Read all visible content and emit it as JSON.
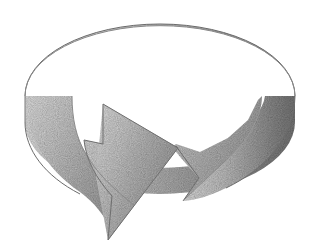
{
  "figure": {
    "kind": "cycle-arrow-illustration",
    "title": "",
    "caption": "",
    "background_color": "#ffffff",
    "width": 320,
    "height": 250
  },
  "shape": {
    "name": "circular-arrow-ribbon",
    "direction": "clockwise",
    "arrowhead": {
      "name": "arrowhead",
      "points": "down-right",
      "tip_x": 108,
      "tip_y": 240
    },
    "tail": {
      "name": "ribbon-tail",
      "style": "v-notch",
      "notch_x": 183,
      "notch_y": 178
    }
  },
  "geometry": {
    "ellipse_center_x": 160,
    "ellipse_center_y": 96,
    "ellipse_radius_x": 135,
    "ellipse_radius_y": 72,
    "band_depth": 66,
    "inner_radius_x": 95,
    "inner_radius_y": 50
  },
  "colors": {
    "background": "#ffffff",
    "highlight": "#e2e2e2",
    "light": "#cfcfcf",
    "mid": "#b0b0b0",
    "dark": "#8a8a8a",
    "darkest": "#6e6e6e",
    "outline": "#5a5a5a",
    "texture": "#7a7a7a"
  },
  "shading": {
    "top_band_light_side": "left",
    "top_band_dark_side": "right",
    "wall_light_side": "left",
    "wall_dark_side": "right",
    "texture_style": "halftone-stipple"
  }
}
